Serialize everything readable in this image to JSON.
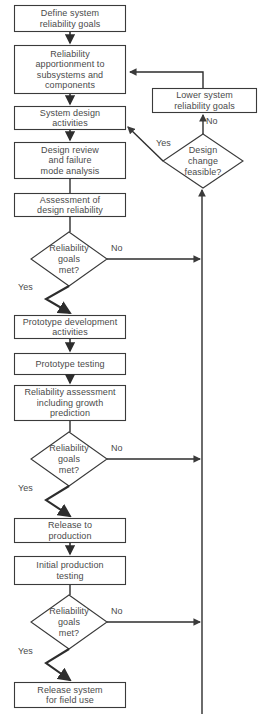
{
  "diagram": {
    "stroke_color": "#3a3a3a",
    "text_color": "#4a4a4a",
    "background_color": "#ffffff",
    "nodes": [
      {
        "id": "define-goals",
        "type": "process",
        "label": "Define system\nreliability goals",
        "x": 14,
        "y": 5,
        "w": 112,
        "h": 27
      },
      {
        "id": "apportionment",
        "type": "process",
        "label": "Reliability\napportionment to\nsubsystems and\ncomponents",
        "x": 14,
        "y": 45,
        "w": 112,
        "h": 49
      },
      {
        "id": "system-design",
        "type": "process",
        "label": "System design\nactivities",
        "x": 14,
        "y": 106,
        "w": 112,
        "h": 24
      },
      {
        "id": "design-review",
        "type": "process",
        "label": "Design review\nand failure\nmode analysis",
        "x": 14,
        "y": 142,
        "w": 112,
        "h": 37
      },
      {
        "id": "assessment",
        "type": "process",
        "label": "Assessment of\ndesign reliability",
        "x": 14,
        "y": 193,
        "w": 112,
        "h": 24
      },
      {
        "id": "decision-design",
        "type": "decision",
        "label": "Reliability\ngoals\nmet?",
        "cx": 69,
        "cy": 259,
        "rx": 38,
        "ry": 27
      },
      {
        "id": "prototype-development",
        "type": "process",
        "label": "Prototype development\nactivities",
        "x": 14,
        "y": 315,
        "w": 112,
        "h": 24
      },
      {
        "id": "prototype-testing",
        "type": "process",
        "label": "Prototype testing",
        "x": 14,
        "y": 353,
        "w": 112,
        "h": 22
      },
      {
        "id": "reliability-assessment",
        "type": "process",
        "label": "Reliability assessment\nincluding growth\nprediction",
        "x": 14,
        "y": 385,
        "w": 112,
        "h": 36
      },
      {
        "id": "decision-prototype",
        "type": "decision",
        "label": "Reliability\ngoals\nmet?",
        "cx": 69,
        "cy": 459,
        "rx": 38,
        "ry": 27
      },
      {
        "id": "release-production",
        "type": "process",
        "label": "Release to\nproduction",
        "x": 14,
        "y": 518,
        "w": 112,
        "h": 25
      },
      {
        "id": "initial-production-testing",
        "type": "process",
        "label": "Initial  production\ntesting",
        "x": 14,
        "y": 556,
        "w": 112,
        "h": 29
      },
      {
        "id": "decision-production",
        "type": "decision",
        "label": "Reliability\ngoals\nmet?",
        "cx": 69,
        "cy": 622,
        "rx": 38,
        "ry": 27
      },
      {
        "id": "release-field",
        "type": "process",
        "label": "Release system\nfor field use",
        "x": 14,
        "y": 682,
        "w": 112,
        "h": 26
      },
      {
        "id": "lower-goals",
        "type": "process",
        "label": "Lower system\nreliability goals",
        "x": 152,
        "y": 88,
        "w": 105,
        "h": 25
      },
      {
        "id": "decision-design-change",
        "type": "decision",
        "label": "Design\nchange\nfeasible?",
        "cx": 203,
        "cy": 161,
        "rx": 40,
        "ry": 27
      }
    ],
    "edge_labels": [
      {
        "id": "no-design",
        "text": "No",
        "x": 111,
        "y": 247
      },
      {
        "id": "yes-design",
        "text": "Yes",
        "x": 18,
        "y": 286
      },
      {
        "id": "no-prototype",
        "text": "No",
        "x": 111,
        "y": 447
      },
      {
        "id": "yes-prototype",
        "text": "Yes",
        "x": 18,
        "y": 487
      },
      {
        "id": "no-production",
        "text": "No",
        "x": 111,
        "y": 610
      },
      {
        "id": "yes-production",
        "text": "Yes",
        "x": 18,
        "y": 650
      },
      {
        "id": "no-feasible",
        "text": "No",
        "x": 206,
        "y": 118
      },
      {
        "id": "yes-feasible",
        "text": "Yes",
        "x": 156,
        "y": 140
      }
    ]
  }
}
